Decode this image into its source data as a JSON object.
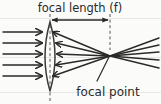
{
  "figure": {
    "kind": "optics-diagram",
    "background_color": "#fbfbfa",
    "ink_color": "#2a2a2a",
    "faint_rule_color": "#e6e6e2",
    "width_px": 161,
    "height_px": 104
  },
  "labels": {
    "focal_length": "focal length (f)",
    "focal_point": "focal point"
  },
  "annotations": {
    "focal_length_measure": {
      "from_x": 50,
      "to_x": 110,
      "y": 20,
      "style": "double-headed-arrow"
    },
    "focal_point_leader": {
      "from_x": 97,
      "from_y": 81,
      "to_x": 109,
      "to_y": 56
    }
  },
  "lens": {
    "type": "biconvex",
    "center_x": 50,
    "top_y": 22,
    "bottom_y": 91,
    "half_width": 9
  },
  "optical_axis": {
    "y": 57,
    "style": "faint-horizontal-rule"
  },
  "dashed_lines": [
    {
      "name": "lens-center-axis",
      "x": 50,
      "y1": 14,
      "y2": 102
    },
    {
      "name": "focal-plane-axis",
      "x": 110,
      "y1": 14,
      "y2": 50
    }
  ],
  "focal_point": {
    "x": 110,
    "y": 56
  },
  "incoming_rays": [
    {
      "y": 32,
      "x_start": 4,
      "x_end": 44
    },
    {
      "y": 43,
      "x_start": 4,
      "x_end": 44
    },
    {
      "y": 54,
      "x_start": 4,
      "x_end": 44
    },
    {
      "y": 65,
      "x_start": 4,
      "x_end": 44
    },
    {
      "y": 76,
      "x_start": 4,
      "x_end": 44
    }
  ],
  "refracted_rays": [
    {
      "x_start": 54,
      "y_start": 32,
      "x_end": 110,
      "y_end": 56
    },
    {
      "x_start": 56,
      "y_start": 43,
      "x_end": 110,
      "y_end": 56
    },
    {
      "x_start": 57,
      "y_start": 54,
      "x_end": 110,
      "y_end": 56
    },
    {
      "x_start": 56,
      "y_start": 65,
      "x_end": 110,
      "y_end": 56
    },
    {
      "x_start": 54,
      "y_start": 76,
      "x_end": 110,
      "y_end": 56
    }
  ],
  "diverging_rays": [
    {
      "x_start": 110,
      "y_start": 56,
      "x_end": 158,
      "y_end": 38
    },
    {
      "x_start": 110,
      "y_start": 56,
      "x_end": 158,
      "y_end": 45
    },
    {
      "x_start": 110,
      "y_start": 56,
      "x_end": 158,
      "y_end": 52
    },
    {
      "x_start": 110,
      "y_start": 56,
      "x_end": 158,
      "y_end": 60
    },
    {
      "x_start": 110,
      "y_start": 56,
      "x_end": 158,
      "y_end": 68
    }
  ],
  "faint_rules": [
    {
      "name": "rule-top",
      "y": 18
    },
    {
      "name": "rule-middle",
      "y": 57
    },
    {
      "name": "rule-bottom",
      "y": 92
    }
  ]
}
